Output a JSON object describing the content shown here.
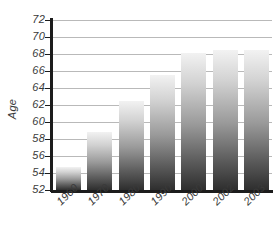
{
  "chart_data": {
    "type": "bar",
    "title": "",
    "subtitle": "",
    "xlabel": "",
    "ylabel": "Age",
    "categories": [
      "1960",
      "1970",
      "1980",
      "1990",
      "2000",
      "2002",
      "2003"
    ],
    "values": [
      54.7,
      58.8,
      62.5,
      65.5,
      68.1,
      68.5,
      68.5
    ],
    "series": [
      {
        "name": "Age",
        "values": [
          54.7,
          58.8,
          62.5,
          65.5,
          68.1,
          68.5,
          68.5
        ]
      }
    ],
    "ylim": [
      52,
      72
    ],
    "ytick_labels": [
      "72",
      "70",
      "68",
      "66",
      "64",
      "62",
      "60",
      "58",
      "56",
      "54",
      "52"
    ],
    "ytick_values": [
      72,
      70,
      68,
      66,
      64,
      62,
      60,
      58,
      56,
      54,
      52
    ],
    "ytick_step": 2,
    "grid": true,
    "grid_axis": "y",
    "legend": false,
    "legend_position": "none",
    "annotations": [],
    "colors": {
      "bar_top": "#f2f2f2",
      "bar_bottom": "#2e2e2e",
      "gridline": "#b9b9b9",
      "axis": "#1c1c1c",
      "text": "#3a3a3a",
      "background": "#ffffff"
    }
  }
}
